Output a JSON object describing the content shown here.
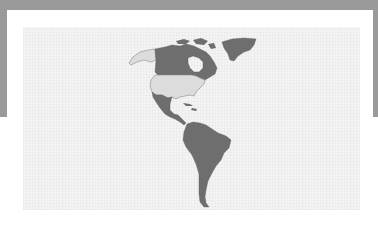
{
  "map": {
    "title": "",
    "region": "Americas",
    "colors": {
      "frame": "#9a9a9a",
      "background": "#ffffff",
      "ocean": "#f4f4f4",
      "highlight_dark": "#6e6e6e",
      "highlight_light": "#dcdcdc",
      "border": "#8a8a8a"
    },
    "regions": [
      {
        "name": "Alaska",
        "shade": "light"
      },
      {
        "name": "Canada",
        "shade": "dark"
      },
      {
        "name": "Greenland",
        "shade": "dark"
      },
      {
        "name": "United States",
        "shade": "light"
      },
      {
        "name": "Mexico",
        "shade": "dark"
      },
      {
        "name": "Central America",
        "shade": "dark"
      },
      {
        "name": "Caribbean",
        "shade": "dark"
      },
      {
        "name": "South America",
        "shade": "dark"
      }
    ]
  }
}
